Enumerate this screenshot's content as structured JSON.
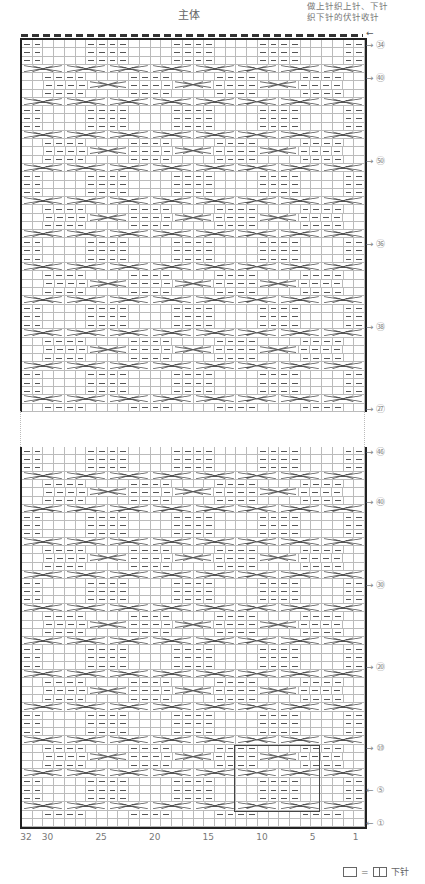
{
  "header": {
    "title": "主体",
    "note": "做上针织上针、下针\n织下针的伏针收针",
    "top_arrow": "←"
  },
  "chart": {
    "columns": 32,
    "top_section": {
      "first_row": 50,
      "last_row": 94
    },
    "bottom_section": {
      "first_row": 1,
      "last_row": 46
    },
    "row_labels_top": [
      {
        "label": "㉞",
        "num": 94,
        "dir": "→"
      },
      {
        "label": "㊵",
        "num": 90,
        "dir": "→"
      },
      {
        "label": "㊿",
        "num": 80,
        "dir": "→"
      },
      {
        "label": "㊱",
        "num": 70,
        "dir": "→"
      },
      {
        "label": "㊳",
        "num": 60,
        "dir": "→"
      },
      {
        "label": "㉗",
        "num": 50,
        "dir": "→"
      }
    ],
    "row_labels_bottom": [
      {
        "label": "㊻",
        "num": 46,
        "dir": "→"
      },
      {
        "label": "㊵",
        "num": 40,
        "dir": "→"
      },
      {
        "label": "㉚",
        "num": 30,
        "dir": "→"
      },
      {
        "label": "⑳",
        "num": 20,
        "dir": "→"
      },
      {
        "label": "⑩",
        "num": 10,
        "dir": "→"
      },
      {
        "label": "⑤",
        "num": 5,
        "dir": "←"
      },
      {
        "label": "①",
        "num": 1,
        "dir": "←"
      }
    ],
    "column_ticks": [
      "32",
      "30",
      "25",
      "20",
      "15",
      "10",
      "5",
      "1"
    ]
  },
  "legend": {
    "equals": "=",
    "label": "下针"
  }
}
